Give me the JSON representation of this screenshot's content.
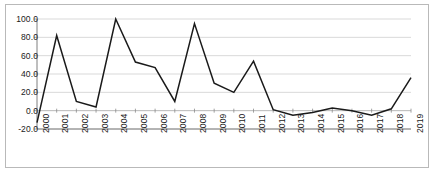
{
  "chart_data": {
    "type": "line",
    "title": "",
    "subtitle": "",
    "xlabel": "",
    "ylabel": "",
    "categories": [
      "2000",
      "2001",
      "2002",
      "2003",
      "2004",
      "2005",
      "2006",
      "2007",
      "2008",
      "2009",
      "2010",
      "2011",
      "2012",
      "2013",
      "2014",
      "2015",
      "2016",
      "2017",
      "2018",
      "2019"
    ],
    "values": [
      -13.0,
      82.0,
      10.0,
      4.0,
      100.0,
      53.0,
      47.0,
      10.0,
      95.0,
      30.0,
      20.0,
      54.0,
      1.0,
      -5.0,
      -2.0,
      3.0,
      0.0,
      -5.0,
      2.0,
      36.0
    ],
    "series": [
      {
        "name": "",
        "values": [
          -13.0,
          82.0,
          10.0,
          4.0,
          100.0,
          53.0,
          47.0,
          10.0,
          95.0,
          30.0,
          20.0,
          54.0,
          1.0,
          -5.0,
          -2.0,
          3.0,
          0.0,
          -5.0,
          2.0,
          36.0
        ]
      }
    ],
    "ylim": [
      -20.0,
      100.0
    ],
    "yticks": [
      -20.0,
      0.0,
      20.0,
      40.0,
      60.0,
      80.0,
      100.0
    ],
    "ytick_labels": [
      "-20.0",
      "0.0",
      "20.0",
      "40.0",
      "60.0",
      "80.0",
      "100.0"
    ],
    "xtick_labels": [
      "2000",
      "2001",
      "2002",
      "2003",
      "2004",
      "2005",
      "2006",
      "2007",
      "2008",
      "2009",
      "2010",
      "2011",
      "2012",
      "2013",
      "2014",
      "2015",
      "2016",
      "2017",
      "2018",
      "2019"
    ],
    "grid": "horizontal",
    "legend": "none",
    "line_color": "#1a1a1a",
    "grid_color": "#c8c8c8",
    "axis_color": "#6f6f6f",
    "background_color": "#ffffff",
    "border_color": "#b9b9b9"
  }
}
